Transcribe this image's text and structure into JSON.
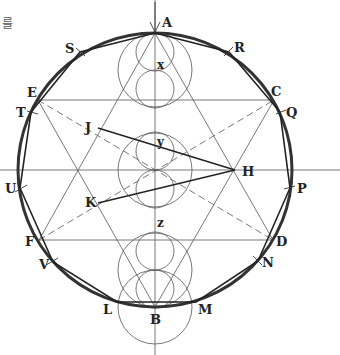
{
  "caption_fragment": "를",
  "diagram": {
    "type": "geometric-construction",
    "center": {
      "x": 155,
      "y": 170
    },
    "main_circle_radius": 137,
    "colors": {
      "stroke": "#333333",
      "thin": "#555555",
      "text": "#222222"
    },
    "points": [
      {
        "id": "A",
        "label": "A",
        "x": 155,
        "y": 33,
        "lx": 162,
        "ly": 27
      },
      {
        "id": "B",
        "label": "B",
        "x": 155,
        "y": 307,
        "lx": 150,
        "ly": 324
      },
      {
        "id": "C",
        "label": "C",
        "x": 274,
        "y": 100,
        "lx": 271,
        "ly": 96
      },
      {
        "id": "D",
        "label": "D",
        "x": 273,
        "y": 240,
        "lx": 276,
        "ly": 246
      },
      {
        "id": "E",
        "label": "E",
        "x": 38,
        "y": 100,
        "lx": 27,
        "ly": 97
      },
      {
        "id": "F",
        "label": "F",
        "x": 39,
        "y": 240,
        "lx": 25,
        "ly": 246
      },
      {
        "id": "H",
        "label": "H",
        "x": 235,
        "y": 170,
        "lx": 242,
        "ly": 176
      },
      {
        "id": "J",
        "label": "J",
        "x": 98,
        "y": 128,
        "lx": 85,
        "ly": 132
      },
      {
        "id": "K",
        "label": "K",
        "x": 98,
        "y": 203,
        "lx": 85,
        "ly": 207
      },
      {
        "id": "L",
        "label": "L",
        "x": 117,
        "y": 302,
        "lx": 103,
        "ly": 314
      },
      {
        "id": "M",
        "label": "M",
        "x": 196,
        "y": 302,
        "lx": 198,
        "ly": 314
      },
      {
        "id": "N",
        "label": "N",
        "x": 258,
        "y": 261,
        "lx": 262,
        "ly": 267
      },
      {
        "id": "P",
        "label": "P",
        "x": 290,
        "y": 188,
        "lx": 297,
        "ly": 193
      },
      {
        "id": "Q",
        "label": "Q",
        "x": 280,
        "y": 112,
        "lx": 286,
        "ly": 117
      },
      {
        "id": "R",
        "label": "R",
        "x": 229,
        "y": 52,
        "lx": 234,
        "ly": 52
      },
      {
        "id": "S",
        "label": "S",
        "x": 80,
        "y": 52,
        "lx": 65,
        "ly": 53
      },
      {
        "id": "T",
        "label": "T",
        "x": 31,
        "y": 112,
        "lx": 16,
        "ly": 117
      },
      {
        "id": "U",
        "label": "U",
        "x": 20,
        "y": 188,
        "lx": 5,
        "ly": 193
      },
      {
        "id": "V",
        "label": "V",
        "x": 53,
        "y": 262,
        "lx": 39,
        "ly": 269
      },
      {
        "id": "x",
        "label": "x",
        "x": 155,
        "y": 71,
        "lx": 157,
        "ly": 69
      },
      {
        "id": "y",
        "label": "y",
        "x": 155,
        "y": 150,
        "lx": 157,
        "ly": 146
      },
      {
        "id": "z",
        "label": "z",
        "x": 155,
        "y": 227,
        "lx": 157,
        "ly": 227
      }
    ],
    "polygon": [
      "A",
      "R",
      "Q",
      "P",
      "N",
      "M",
      "L",
      "V",
      "U",
      "T",
      "S"
    ],
    "axes": {
      "horizontal_y": 170,
      "vertical_x": 155
    }
  }
}
